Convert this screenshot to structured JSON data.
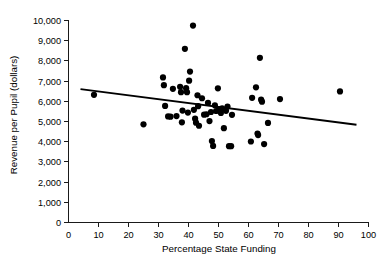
{
  "chart_data": {
    "type": "scatter",
    "title": "",
    "xlabel": "Percentage State Funding",
    "ylabel": "Revenue per Pupil (dollars)",
    "xlim": [
      0,
      100
    ],
    "ylim": [
      0,
      10000
    ],
    "grid": false,
    "legend": null,
    "x_ticks": [
      0,
      10,
      20,
      30,
      40,
      50,
      60,
      70,
      80,
      90,
      100
    ],
    "x_tick_labels": [
      "0",
      "10",
      "20",
      "30",
      "40",
      "50",
      "60",
      "70",
      "80",
      "90",
      "100"
    ],
    "y_ticks": [
      0,
      1000,
      2000,
      3000,
      4000,
      5000,
      6000,
      7000,
      8000,
      9000,
      10000
    ],
    "y_tick_labels": [
      "0",
      "1,000",
      "2,000",
      "3,000",
      "4,000",
      "5,000",
      "6,000",
      "7,000",
      "8,000",
      "9,000",
      "10,000"
    ],
    "marker": {
      "shape": "circle",
      "color": "#000000",
      "radius_px": 3.1
    },
    "points": [
      [
        8.5,
        6320
      ],
      [
        25.0,
        4860
      ],
      [
        31.5,
        7180
      ],
      [
        31.8,
        6800
      ],
      [
        32.2,
        5770
      ],
      [
        33.2,
        5250
      ],
      [
        34.0,
        5240
      ],
      [
        34.8,
        6620
      ],
      [
        36.0,
        5270
      ],
      [
        37.2,
        6720
      ],
      [
        37.5,
        6450
      ],
      [
        37.8,
        4960
      ],
      [
        38.0,
        5540
      ],
      [
        38.8,
        8600
      ],
      [
        39.2,
        6650
      ],
      [
        39.5,
        6450
      ],
      [
        39.8,
        5440
      ],
      [
        40.2,
        7020
      ],
      [
        40.5,
        7470
      ],
      [
        41.5,
        9750
      ],
      [
        41.8,
        5580
      ],
      [
        42.2,
        5140
      ],
      [
        42.5,
        4940
      ],
      [
        43.0,
        6300
      ],
      [
        43.2,
        5760
      ],
      [
        43.5,
        4790
      ],
      [
        44.5,
        6150
      ],
      [
        45.2,
        5340
      ],
      [
        46.0,
        5360
      ],
      [
        46.5,
        5920
      ],
      [
        47.0,
        5020
      ],
      [
        47.5,
        5470
      ],
      [
        47.8,
        4030
      ],
      [
        48.2,
        3790
      ],
      [
        48.8,
        5800
      ],
      [
        49.2,
        5520
      ],
      [
        49.8,
        6640
      ],
      [
        50.2,
        5600
      ],
      [
        50.8,
        5420
      ],
      [
        51.2,
        5650
      ],
      [
        51.8,
        4670
      ],
      [
        52.5,
        5530
      ],
      [
        53.0,
        5740
      ],
      [
        53.5,
        3780
      ],
      [
        54.2,
        3780
      ],
      [
        54.5,
        5330
      ],
      [
        60.8,
        4010
      ],
      [
        61.2,
        6170
      ],
      [
        62.5,
        6690
      ],
      [
        63.0,
        4400
      ],
      [
        63.2,
        4330
      ],
      [
        63.8,
        8150
      ],
      [
        64.2,
        6080
      ],
      [
        64.5,
        5980
      ],
      [
        65.2,
        3880
      ],
      [
        66.5,
        4930
      ],
      [
        70.5,
        6110
      ],
      [
        90.5,
        6490
      ]
    ],
    "trend_line": {
      "label": "least-squares regression line",
      "x_start": 4,
      "y_start": 6600,
      "x_end": 96,
      "y_end": 4840
    }
  }
}
